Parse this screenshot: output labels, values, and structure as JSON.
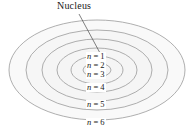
{
  "figure": {
    "background_color": "#ffffff",
    "orbit_stroke_color": "#9a9a9a",
    "orbit_fill_color": "#f4f4f4",
    "text_color": "#1a1a1a",
    "leader_line_color": "#4a4a4a"
  },
  "annotations": {
    "nucleus_label": "Nucleus"
  },
  "chart_data": {
    "type": "diagram",
    "center": {
      "x": 97,
      "y": 70
    },
    "shells": [
      {
        "label": "n = 1",
        "n": 1,
        "rx": 14,
        "ry": 7,
        "label_x": 86,
        "label_y": 52
      },
      {
        "label": "n = 2",
        "n": 2,
        "rx": 26,
        "ry": 14,
        "label_x": 86,
        "label_y": 61
      },
      {
        "label": "n = 3",
        "n": 3,
        "rx": 40,
        "ry": 22,
        "label_x": 86,
        "label_y": 70
      },
      {
        "label": "n = 4",
        "n": 4,
        "rx": 55,
        "ry": 31,
        "label_x": 86,
        "label_y": 83
      },
      {
        "label": "n = 5",
        "n": 5,
        "rx": 71,
        "ry": 40,
        "label_x": 86,
        "label_y": 100
      },
      {
        "label": "n = 6",
        "n": 6,
        "rx": 88,
        "ry": 50,
        "label_x": 86,
        "label_y": 118
      }
    ],
    "leader_line": {
      "x1": 79,
      "y1": 14,
      "x2": 100,
      "y2": 53
    }
  }
}
